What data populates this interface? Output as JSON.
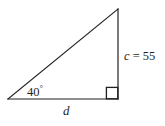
{
  "figure": {
    "kind": "right-triangle-diagram",
    "background_color": "#ffffff",
    "stroke_color": "#231f20",
    "labels": {
      "angle_value": "40",
      "angle_degree_symbol": "°",
      "angle_full": "40°",
      "vertical_leg_variable": "c",
      "vertical_leg_equals": " = 55",
      "vertical_leg_full": "c = 55",
      "vertical_leg_value": "55",
      "base_variable": "d"
    },
    "icons": {
      "right_angle_marker": "right-angle-square-icon"
    },
    "geometry": {
      "left_vertex": [
        8,
        99
      ],
      "right_vertex": [
        118,
        99
      ],
      "apex_vertex": [
        118,
        9
      ],
      "right_angle_square": [
        106,
        87,
        12,
        12
      ]
    }
  }
}
